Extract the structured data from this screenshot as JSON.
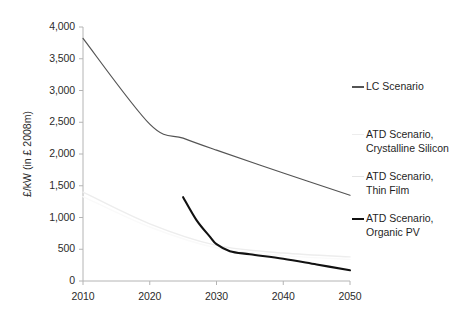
{
  "chart_data": {
    "type": "line",
    "title": "",
    "xlabel": "",
    "ylabel": "£/kW (in £ 2008m)",
    "xlim": [
      2010,
      2050
    ],
    "ylim": [
      0,
      4000
    ],
    "xticks": [
      "2010",
      "2020",
      "2030",
      "2040",
      "2050"
    ],
    "yticks": [
      "0",
      "500",
      "1,000",
      "1,500",
      "2,000",
      "2,500",
      "3,000",
      "3,500",
      "4,000"
    ],
    "grid": false,
    "legend_position": "right",
    "series": [
      {
        "name": "LC Scenario",
        "color": "#545454",
        "width": 1.2,
        "x": [
          2010,
          2020,
          2025,
          2030,
          2040,
          2050
        ],
        "values": [
          3820,
          2470,
          2250,
          2060,
          1700,
          1350
        ]
      },
      {
        "name": "ATD Scenario, Crystalline Silicon",
        "color": "#ededed",
        "width": 1.4,
        "x": [
          2010,
          2020,
          2030,
          2040,
          2050
        ],
        "values": [
          1400,
          900,
          560,
          440,
          380
        ]
      },
      {
        "name": "ATD Scenario, Thin Film",
        "color": "#fafafa",
        "width": 1.4,
        "x": [
          2010,
          2020,
          2030,
          2040,
          2050
        ],
        "values": [
          1330,
          850,
          520,
          400,
          340
        ]
      },
      {
        "name": "ATD Scenario, Organic PV",
        "color": "#111111",
        "width": 2.1,
        "x": [
          2025,
          2027,
          2029,
          2030,
          2032,
          2035,
          2040,
          2045,
          2050
        ],
        "values": [
          1320,
          960,
          700,
          580,
          470,
          420,
          350,
          260,
          170
        ]
      }
    ]
  },
  "axes": {
    "y_title": "£/kW (in £ 2008m)",
    "y_ticks": [
      {
        "label": "4,000",
        "value": 4000
      },
      {
        "label": "3,500",
        "value": 3500
      },
      {
        "label": "3,000",
        "value": 3000
      },
      {
        "label": "2,500",
        "value": 2500
      },
      {
        "label": "2,000",
        "value": 2000
      },
      {
        "label": "1,500",
        "value": 1500
      },
      {
        "label": "1,000",
        "value": 1000
      },
      {
        "label": "500",
        "value": 500
      },
      {
        "label": "0",
        "value": 0
      }
    ],
    "x_ticks": [
      {
        "label": "2010",
        "value": 2010
      },
      {
        "label": "2020",
        "value": 2020
      },
      {
        "label": "2030",
        "value": 2030
      },
      {
        "label": "2040",
        "value": 2040
      },
      {
        "label": "2050",
        "value": 2050
      }
    ]
  },
  "legend": {
    "entries": [
      {
        "label": "LC Scenario",
        "color": "#545454",
        "visible_swatch": true
      },
      {
        "label": "ATD Scenario,\nCrystalline Silicon",
        "color": "#ededed",
        "visible_swatch": false
      },
      {
        "label": "ATD Scenario,\nThin Film",
        "color": "#e4e4e4",
        "visible_swatch": false
      },
      {
        "label": "ATD Scenario,\nOrganic PV",
        "color": "#111111",
        "visible_swatch": true
      }
    ]
  }
}
